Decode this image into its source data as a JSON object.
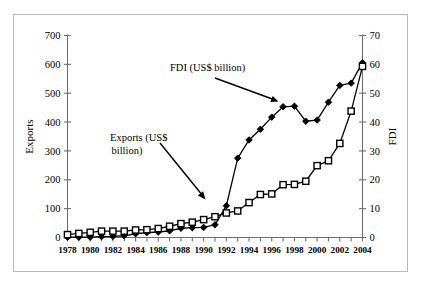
{
  "figure": {
    "background_color": "#ffffff",
    "frame_color": "#b9b9b9",
    "line_color": "#000000",
    "axis_color": "#6f6f6f"
  },
  "annotations": {
    "fdi_label": "FDI (US$ billion)",
    "exports_label_line1": "Exports (US$",
    "exports_label_line2": "billion)"
  },
  "chart_data": {
    "type": "line",
    "title": "",
    "xlabel": "",
    "ylabel": "Exports",
    "y2label": "FDI",
    "grid": false,
    "legend_position": "annotations",
    "x": [
      1978,
      1979,
      1980,
      1981,
      1982,
      1983,
      1984,
      1985,
      1986,
      1987,
      1988,
      1989,
      1990,
      1991,
      1992,
      1993,
      1994,
      1995,
      1996,
      1997,
      1998,
      1999,
      2000,
      2001,
      2002,
      2003,
      2004
    ],
    "xtick_labels": [
      "1978",
      "1980",
      "1982",
      "1984",
      "1986",
      "1988",
      "1990",
      "1992",
      "1994",
      "1996",
      "1998",
      "2000",
      "2002",
      "2004"
    ],
    "xtick_values": [
      1978,
      1980,
      1982,
      1984,
      1986,
      1988,
      1990,
      1992,
      1994,
      1996,
      1998,
      2000,
      2002,
      2004
    ],
    "xlim": [
      1978,
      2004
    ],
    "ylim": [
      0,
      700
    ],
    "ytick_labels": [
      "0",
      "100",
      "200",
      "300",
      "400",
      "500",
      "600",
      "700"
    ],
    "ytick_values": [
      0,
      100,
      200,
      300,
      400,
      500,
      600,
      700
    ],
    "y2lim": [
      0,
      70
    ],
    "y2tick_labels": [
      "0",
      "10",
      "20",
      "30",
      "40",
      "50",
      "60",
      "70"
    ],
    "y2tick_values": [
      0,
      10,
      20,
      30,
      40,
      50,
      60,
      70
    ],
    "series": [
      {
        "name": "Exports (US$ billion)",
        "axis": "left",
        "marker": "open-square",
        "values": [
          10,
          14,
          18,
          22,
          22,
          22,
          26,
          27,
          31,
          39,
          48,
          53,
          62,
          72,
          85,
          92,
          121,
          149,
          151,
          183,
          184,
          195,
          249,
          266,
          326,
          438,
          593
        ]
      },
      {
        "name": "FDI (US$ billion)",
        "axis": "right",
        "marker": "filled-diamond",
        "values": [
          0.1,
          0.1,
          0.1,
          0.3,
          0.4,
          0.6,
          1.3,
          1.7,
          1.9,
          2.3,
          3.2,
          3.4,
          3.5,
          4.4,
          11.0,
          27.5,
          33.8,
          37.5,
          41.7,
          45.3,
          45.5,
          40.3,
          40.7,
          46.9,
          52.7,
          53.5,
          60.6
        ]
      }
    ]
  }
}
